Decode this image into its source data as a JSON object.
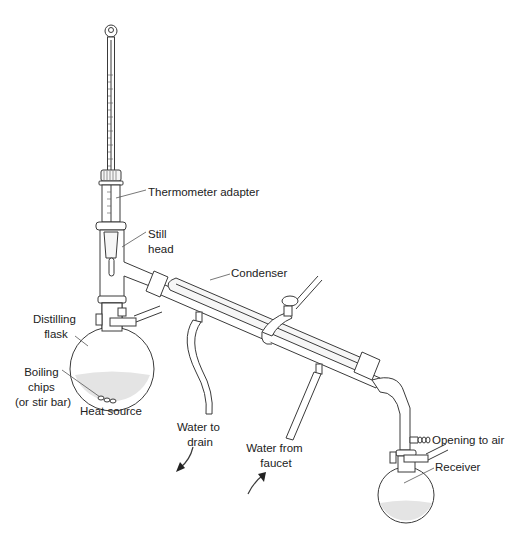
{
  "figure": {
    "labels": {
      "thermometer_adapter": "Thermometer adapter",
      "still_head_line1": "Still",
      "still_head_line2": "head",
      "condenser": "Condenser",
      "distilling_flask_line1": "Distilling",
      "distilling_flask_line2": "flask",
      "boiling_chips_line1": "Boiling",
      "boiling_chips_line2": "chips",
      "boiling_chips_line3": "(or stir bar)",
      "heat_source": "Heat source",
      "water_to_drain_line1": "Water to",
      "water_to_drain_line2": "drain",
      "water_from_faucet_line1": "Water from",
      "water_from_faucet_line2": "faucet",
      "opening_to_air": "Opening to air",
      "receiver": "Receiver"
    },
    "components": [
      "thermometer",
      "thermometer-adapter",
      "still-head",
      "distilling-flask",
      "boiling-chips",
      "condenser",
      "clamp",
      "water-inlet-hose",
      "water-outlet-hose",
      "vacuum-adapter",
      "receiver-flask"
    ],
    "colors": {
      "line": "#3a3a3a",
      "liquid": "#e4e4e4",
      "background": "#ffffff"
    }
  }
}
